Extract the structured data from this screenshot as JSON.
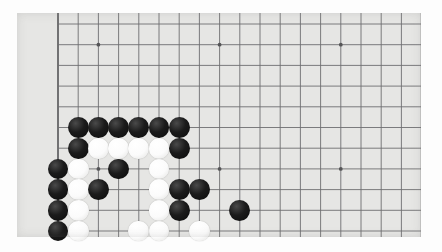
{
  "scene": {
    "title": "Go board photograph",
    "description": "Close-up photo of a lower-left corner of a Go board with black and white stones",
    "board_color": "#e6e6e4",
    "line_color": "#6e6e70",
    "edge_color": "#555557",
    "black_stone_color": "#111111",
    "white_stone_color": "#fafafa",
    "photo_background": "#fdfdfd"
  },
  "board": {
    "left": 17,
    "top": 13,
    "width": 404,
    "height": 224,
    "origin_x": 58,
    "origin_y": 11,
    "cell_w": 20.2,
    "cell_h": 20.7,
    "cols": 18,
    "rows": 11,
    "stone_radius": 10.4,
    "edge_line_width": 1.6,
    "inner_line_width": 0.9,
    "star_points": [
      {
        "col": 2,
        "row": 1
      },
      {
        "col": 8,
        "row": 1
      },
      {
        "col": 14,
        "row": 1
      },
      {
        "col": 2,
        "row": 7
      },
      {
        "col": 8,
        "row": 7
      },
      {
        "col": 14,
        "row": 7
      }
    ],
    "edges": {
      "left": true,
      "bottom": true,
      "right": true,
      "top": false
    }
  },
  "stones": [
    {
      "color": "black",
      "col": 1,
      "row": 5
    },
    {
      "color": "black",
      "col": 2,
      "row": 5
    },
    {
      "color": "black",
      "col": 3,
      "row": 5
    },
    {
      "color": "black",
      "col": 4,
      "row": 5
    },
    {
      "color": "black",
      "col": 5,
      "row": 5
    },
    {
      "color": "black",
      "col": 6,
      "row": 5
    },
    {
      "color": "black",
      "col": 1,
      "row": 6
    },
    {
      "color": "white",
      "col": 2,
      "row": 6
    },
    {
      "color": "white",
      "col": 3,
      "row": 6
    },
    {
      "color": "white",
      "col": 4,
      "row": 6
    },
    {
      "color": "white",
      "col": 5,
      "row": 6
    },
    {
      "color": "black",
      "col": 6,
      "row": 6
    },
    {
      "color": "black",
      "col": 0,
      "row": 7
    },
    {
      "color": "white",
      "col": 1,
      "row": 7
    },
    {
      "color": "black",
      "col": 3,
      "row": 7
    },
    {
      "color": "white",
      "col": 5,
      "row": 7
    },
    {
      "color": "black",
      "col": 0,
      "row": 8
    },
    {
      "color": "white",
      "col": 1,
      "row": 8
    },
    {
      "color": "black",
      "col": 2,
      "row": 8
    },
    {
      "color": "white",
      "col": 5,
      "row": 8
    },
    {
      "color": "black",
      "col": 6,
      "row": 8
    },
    {
      "color": "black",
      "col": 7,
      "row": 8
    },
    {
      "color": "black",
      "col": 0,
      "row": 9
    },
    {
      "color": "white",
      "col": 1,
      "row": 9
    },
    {
      "color": "white",
      "col": 5,
      "row": 9
    },
    {
      "color": "black",
      "col": 6,
      "row": 9
    },
    {
      "color": "black",
      "col": 9,
      "row": 9
    },
    {
      "color": "black",
      "col": 0,
      "row": 10
    },
    {
      "color": "white",
      "col": 1,
      "row": 10
    },
    {
      "color": "white",
      "col": 4,
      "row": 10
    },
    {
      "color": "white",
      "col": 5,
      "row": 10
    },
    {
      "color": "white",
      "col": 7,
      "row": 10
    }
  ]
}
